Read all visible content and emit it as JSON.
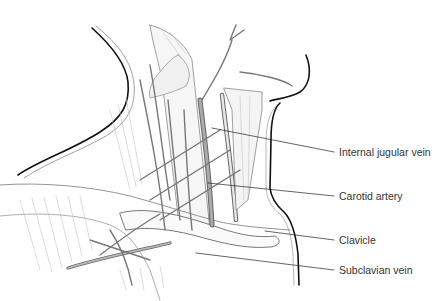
{
  "figure": {
    "colors": {
      "outline": "#111111",
      "structure": "#777777",
      "vessel_fill": "#9a9a9a",
      "muscle_hatch": "#bbbbbb",
      "label_text": "#333333",
      "leader_line": "#222222"
    },
    "labels": [
      {
        "id": "internal-jugular-vein",
        "text": "Internal jugular vein",
        "x": 339,
        "y": 147,
        "target": [
          212,
          128
        ]
      },
      {
        "id": "carotid-artery",
        "text": "Carotid artery",
        "x": 339,
        "y": 191,
        "target": [
          208,
          183
        ]
      },
      {
        "id": "clavicle",
        "text": "Clavicle",
        "x": 339,
        "y": 235,
        "target": [
          265,
          231
        ]
      },
      {
        "id": "subclavian-vein",
        "text": "Subclavian vein",
        "x": 339,
        "y": 265,
        "target": [
          196,
          253
        ]
      }
    ]
  }
}
